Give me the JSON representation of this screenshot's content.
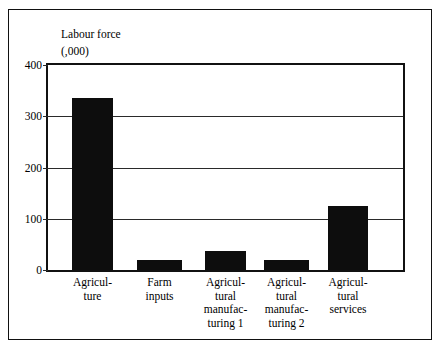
{
  "chart_data": {
    "type": "bar",
    "title": "",
    "ylabel_lines": [
      "Labour force",
      "(,000)"
    ],
    "xlabel": "",
    "categories": [
      "Agricul-\nture",
      "Farm\ninputs",
      "Agricul-\ntural\nmanufac-\nturing 1",
      "Agricul-\ntural\nmanufac-\nturing 2",
      "Agricul-\ntural\nservices"
    ],
    "values": [
      335,
      20,
      37,
      19,
      125
    ],
    "ylim": [
      0,
      400
    ],
    "yticks": [
      0,
      100,
      200,
      300,
      400
    ],
    "ytick_labels": [
      "0",
      "100",
      "200",
      "300",
      "400"
    ],
    "grid": true,
    "legend": "none",
    "bar_color": "#0d0d0d",
    "axis_color": "#111111",
    "background": "#ffffff"
  }
}
